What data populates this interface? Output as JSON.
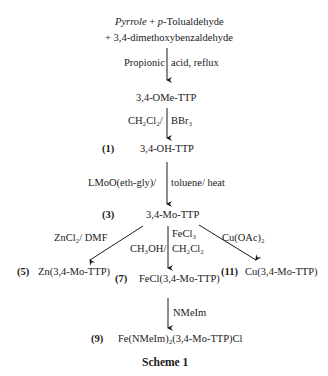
{
  "scheme": {
    "title": "Scheme 1",
    "start": {
      "reagent1": "Pyrrole",
      "plus1": " + ",
      "reagent2_prefix": "p",
      "reagent2_rest": "-Tolualdehyde",
      "line2": "+  3,4-dimethoxybenzaldehyde"
    },
    "steps": [
      {
        "conditions_left": "Propionic",
        "conditions_right": "acid, reflux"
      },
      {
        "conditions_left": "CH₂Cl₂/",
        "conditions_right": "BBr₃"
      },
      {
        "conditions_left": "LMoO(eth-gly)/",
        "conditions_right": "toluene/ heat"
      }
    ],
    "compounds": {
      "ome_ttp": {
        "label": "",
        "name": "3,4-OMe-TTP"
      },
      "oh_ttp": {
        "label": "(1)",
        "name": "3,4-OH-TTP"
      },
      "mo_ttp": {
        "label": "(3)",
        "name": "3,4-Mo-TTP"
      },
      "zn": {
        "label": "(5)",
        "name": "Zn(3,4-Mo-TTP)"
      },
      "fecl": {
        "label": "(7)",
        "name": "FeCl(3,4-Mo-TTP)"
      },
      "cu": {
        "label": "(11)",
        "name": "Cu(3,4-Mo-TTP)"
      },
      "fe_nmeim": {
        "label": "(9)",
        "name_prefix": "Fe(NMeIm)",
        "name_sub": "2",
        "name_suffix": "(3,4-Mo-TTP)Cl"
      }
    },
    "branches": {
      "left": "ZnCl₂/ DMF",
      "center_top": "FeCl₃",
      "center_left": "CH₃OH/",
      "center_right": "CH₂Cl₂",
      "right": "Cu(OAc)₂",
      "final": "NMeIm"
    }
  }
}
